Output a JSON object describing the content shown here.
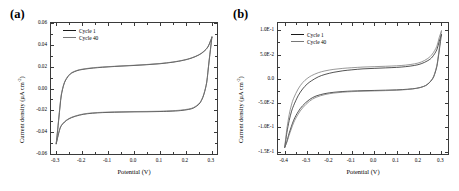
{
  "figure": {
    "panels": [
      {
        "tag": "(a)",
        "xlabel": "Potential (V)",
        "ylabel_main": "Current density (",
        "ylabel_unit": "µA cm",
        "ylabel_exp": "-2",
        "ylabel_close": ")",
        "legend": [
          {
            "label": "Cycle 1",
            "color": "#1a1a1a"
          },
          {
            "label": "Cycle 40",
            "color": "#777777"
          }
        ],
        "xticks": [
          "-0.3",
          "-0.2",
          "-0.1",
          "0.0",
          "0.1",
          "0.2",
          "0.3"
        ],
        "yticks": [
          "0.06",
          "0.04",
          "0.02",
          "0.00",
          "-0.02",
          "-0.04",
          "-0.06"
        ]
      },
      {
        "tag": "(b)",
        "xlabel": "Potential (V)",
        "ylabel_main": "Current density (",
        "ylabel_unit": "µA cm",
        "ylabel_exp": "-2",
        "ylabel_close": ")",
        "legend": [
          {
            "label": "Cycle 1",
            "color": "#1a1a1a"
          },
          {
            "label": "Cycle 40",
            "color": "#777777"
          }
        ],
        "xticks": [
          "-0.4",
          "-0.3",
          "-0.2",
          "-0.1",
          "0.0",
          "0.1",
          "0.2",
          "0.3"
        ],
        "yticks": [
          "1.0E-1",
          "5.0E-2",
          "0.0",
          "-5.0E-2",
          "-1.0E-1",
          "-1.5E-1"
        ]
      }
    ]
  },
  "chart_data": [
    {
      "type": "line",
      "title": "(a)",
      "xlabel": "Potential (V)",
      "ylabel": "Current density (µA cm-2)",
      "xlim": [
        -0.32,
        0.32
      ],
      "ylim": [
        -0.06,
        0.06
      ],
      "xticks": [
        -0.3,
        -0.2,
        -0.1,
        0.0,
        0.1,
        0.2,
        0.3
      ],
      "yticks": [
        -0.06,
        -0.04,
        -0.02,
        0.0,
        0.02,
        0.04,
        0.06
      ],
      "grid": false,
      "legend_position": "top-left",
      "series": [
        {
          "name": "Cycle 1",
          "color": "#1a1a1a",
          "upper_branch": {
            "x": [
              -0.3,
              -0.295,
              -0.29,
              -0.285,
              -0.28,
              -0.27,
              -0.26,
              -0.25,
              -0.24,
              -0.22,
              -0.2,
              -0.17,
              -0.14,
              -0.1,
              -0.05,
              0.0,
              0.05,
              0.1,
              0.15,
              0.19,
              0.22,
              0.25,
              0.27,
              0.285,
              0.295,
              0.3
            ],
            "y": [
              -0.051,
              -0.04,
              -0.028,
              -0.016,
              -0.006,
              0.004,
              0.009,
              0.0122,
              0.0142,
              0.0163,
              0.0174,
              0.0184,
              0.0191,
              0.0198,
              0.0205,
              0.0211,
              0.0218,
              0.0227,
              0.0241,
              0.0258,
              0.0277,
              0.0307,
              0.034,
              0.038,
              0.0435,
              0.0465
            ]
          },
          "lower_branch": {
            "x": [
              0.3,
              0.295,
              0.29,
              0.285,
              0.28,
              0.27,
              0.26,
              0.25,
              0.23,
              0.21,
              0.18,
              0.15,
              0.1,
              0.05,
              0.0,
              -0.05,
              -0.1,
              -0.14,
              -0.18,
              -0.21,
              -0.24,
              -0.26,
              -0.275,
              -0.285,
              -0.295,
              -0.3
            ],
            "y": [
              0.0465,
              0.036,
              0.026,
              0.015,
              0.005,
              -0.005,
              -0.011,
              -0.0145,
              -0.0178,
              -0.0192,
              -0.0202,
              -0.0207,
              -0.0211,
              -0.0213,
              -0.0214,
              -0.0216,
              -0.0219,
              -0.0223,
              -0.0231,
              -0.0244,
              -0.0266,
              -0.0292,
              -0.0325,
              -0.0365,
              -0.0455,
              -0.051
            ]
          }
        },
        {
          "name": "Cycle 40",
          "color": "#777777",
          "upper_branch": {
            "x": [
              -0.3,
              -0.295,
              -0.29,
              -0.285,
              -0.28,
              -0.27,
              -0.26,
              -0.25,
              -0.24,
              -0.22,
              -0.2,
              -0.17,
              -0.14,
              -0.1,
              -0.05,
              0.0,
              0.05,
              0.1,
              0.15,
              0.19,
              0.22,
              0.25,
              0.27,
              0.285,
              0.295,
              0.3
            ],
            "y": [
              -0.0505,
              -0.039,
              -0.027,
              -0.015,
              -0.005,
              0.0045,
              0.0095,
              0.0126,
              0.0146,
              0.0166,
              0.0177,
              0.0187,
              0.0194,
              0.02,
              0.0207,
              0.0213,
              0.022,
              0.0229,
              0.0243,
              0.026,
              0.0279,
              0.0309,
              0.0343,
              0.0383,
              0.0438,
              0.0468
            ]
          },
          "lower_branch": {
            "x": [
              0.3,
              0.295,
              0.29,
              0.285,
              0.28,
              0.27,
              0.26,
              0.25,
              0.23,
              0.21,
              0.18,
              0.15,
              0.1,
              0.05,
              0.0,
              -0.05,
              -0.1,
              -0.14,
              -0.18,
              -0.21,
              -0.24,
              -0.26,
              -0.275,
              -0.285,
              -0.295,
              -0.3
            ],
            "y": [
              0.0468,
              0.0365,
              0.0265,
              0.0155,
              0.0055,
              -0.0045,
              -0.0105,
              -0.014,
              -0.0174,
              -0.0188,
              -0.0198,
              -0.0203,
              -0.0208,
              -0.021,
              -0.0211,
              -0.0213,
              -0.0216,
              -0.022,
              -0.0228,
              -0.0241,
              -0.0263,
              -0.0289,
              -0.0322,
              -0.0362,
              -0.0452,
              -0.0505
            ]
          }
        }
      ]
    },
    {
      "type": "line",
      "title": "(b)",
      "xlabel": "Potential (V)",
      "ylabel": "Current density (µA cm-2)",
      "xlim": [
        -0.43,
        0.33
      ],
      "ylim": [
        -0.155,
        0.115
      ],
      "xticks": [
        -0.4,
        -0.3,
        -0.2,
        -0.1,
        0.0,
        0.1,
        0.2,
        0.3
      ],
      "yticks": [
        -0.15,
        -0.1,
        -0.05,
        0.0,
        0.05,
        0.1
      ],
      "grid": false,
      "legend_position": "top-left",
      "series": [
        {
          "name": "Cycle 1",
          "color": "#1a1a1a",
          "upper_branch": {
            "x": [
              -0.4,
              -0.395,
              -0.39,
              -0.38,
              -0.37,
              -0.36,
              -0.34,
              -0.32,
              -0.3,
              -0.28,
              -0.25,
              -0.22,
              -0.18,
              -0.14,
              -0.1,
              -0.05,
              0.0,
              0.05,
              0.1,
              0.14,
              0.18,
              0.21,
              0.24,
              0.26,
              0.28,
              0.29,
              0.3
            ],
            "y": [
              -0.142,
              -0.126,
              -0.11,
              -0.086,
              -0.068,
              -0.055,
              -0.035,
              -0.021,
              -0.011,
              -0.004,
              0.004,
              0.009,
              0.0135,
              0.0165,
              0.0185,
              0.0205,
              0.0215,
              0.0225,
              0.0235,
              0.025,
              0.0275,
              0.031,
              0.0375,
              0.045,
              0.06,
              0.076,
              0.09
            ]
          },
          "lower_branch": {
            "x": [
              0.3,
              0.295,
              0.29,
              0.285,
              0.28,
              0.27,
              0.26,
              0.24,
              0.22,
              0.19,
              0.15,
              0.1,
              0.05,
              0.0,
              -0.05,
              -0.1,
              -0.14,
              -0.18,
              -0.22,
              -0.26,
              -0.29,
              -0.32,
              -0.34,
              -0.36,
              -0.38,
              -0.39,
              -0.4
            ],
            "y": [
              0.09,
              0.072,
              0.055,
              0.039,
              0.025,
              0.009,
              -0.001,
              -0.011,
              -0.016,
              -0.0195,
              -0.0215,
              -0.0228,
              -0.0235,
              -0.024,
              -0.0245,
              -0.0253,
              -0.0262,
              -0.0278,
              -0.0305,
              -0.0355,
              -0.043,
              -0.0555,
              -0.068,
              -0.0855,
              -0.112,
              -0.129,
              -0.142
            ]
          }
        },
        {
          "name": "Cycle 40",
          "color": "#777777",
          "upper_branch": {
            "x": [
              -0.4,
              -0.395,
              -0.39,
              -0.38,
              -0.37,
              -0.36,
              -0.34,
              -0.32,
              -0.3,
              -0.28,
              -0.25,
              -0.22,
              -0.18,
              -0.14,
              -0.1,
              -0.05,
              0.0,
              0.05,
              0.1,
              0.14,
              0.18,
              0.21,
              0.24,
              0.26,
              0.28,
              0.29,
              0.3
            ],
            "y": [
              -0.14,
              -0.121,
              -0.102,
              -0.074,
              -0.054,
              -0.04,
              -0.021,
              -0.008,
              0.0005,
              0.0065,
              0.0125,
              0.0163,
              0.0195,
              0.0215,
              0.0228,
              0.0242,
              0.025,
              0.0258,
              0.0268,
              0.0282,
              0.0308,
              0.0345,
              0.042,
              0.051,
              0.067,
              0.084,
              0.0975
            ]
          },
          "lower_branch": {
            "x": [
              0.3,
              0.295,
              0.29,
              0.285,
              0.28,
              0.27,
              0.26,
              0.24,
              0.22,
              0.19,
              0.15,
              0.1,
              0.05,
              0.0,
              -0.05,
              -0.1,
              -0.14,
              -0.18,
              -0.22,
              -0.26,
              -0.29,
              -0.32,
              -0.34,
              -0.36,
              -0.38,
              -0.39,
              -0.4
            ],
            "y": [
              0.0975,
              0.078,
              0.059,
              0.042,
              0.027,
              0.0105,
              0.0,
              -0.0105,
              -0.0158,
              -0.0196,
              -0.022,
              -0.0236,
              -0.0244,
              -0.025,
              -0.0256,
              -0.0265,
              -0.0276,
              -0.0294,
              -0.0325,
              -0.0382,
              -0.0465,
              -0.06,
              -0.073,
              -0.0905,
              -0.116,
              -0.13,
              -0.14
            ]
          }
        }
      ]
    }
  ]
}
